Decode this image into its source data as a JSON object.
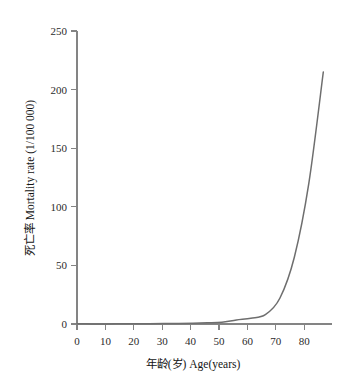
{
  "chart_data": {
    "type": "line",
    "title": "",
    "xlabel": "年龄(岁) Age(years)",
    "ylabel": "死亡率 Mortality rate (1/100 000)",
    "xlim": [
      0,
      88
    ],
    "ylim": [
      0,
      250
    ],
    "xticks": [
      0,
      10,
      20,
      30,
      40,
      50,
      60,
      70,
      80
    ],
    "yticks": [
      0,
      50,
      100,
      150,
      200,
      250
    ],
    "xtick_labels": [
      "0",
      "10",
      "20",
      "30",
      "40",
      "50",
      "60",
      "70",
      "80"
    ],
    "ytick_labels": [
      "0",
      "50",
      "100",
      "150",
      "200",
      "250"
    ],
    "grid": false,
    "legend": false,
    "series": [
      {
        "name": "Mortality rate",
        "color": "#6e6e6e",
        "x": [
          0,
          5,
          10,
          15,
          20,
          25,
          30,
          35,
          40,
          45,
          50,
          55,
          60,
          65,
          70,
          75,
          80,
          85
        ],
        "values": [
          0.2,
          0.1,
          0.1,
          0.15,
          0.2,
          0.3,
          0.4,
          0.5,
          0.7,
          1.0,
          1.5,
          3.5,
          5.0,
          8.0,
          22.0,
          57.0,
          120.0,
          215.0
        ]
      }
    ]
  },
  "axes": {
    "x_axis_name": "x-axis",
    "y_axis_name": "y-axis"
  }
}
